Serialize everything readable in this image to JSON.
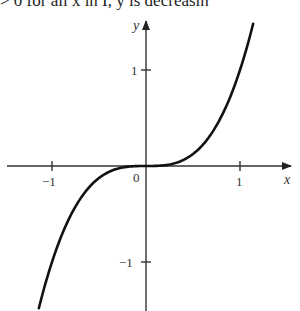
{
  "caption": {
    "text": "> 0 for all x in I, y is decreasin"
  },
  "chart_data": {
    "type": "line",
    "title": "",
    "function": "y = x^3",
    "xlabel": "x",
    "ylabel": "y",
    "xlim": [
      -1.45,
      1.55
    ],
    "ylim": [
      -1.5,
      1.5
    ],
    "grid": false,
    "legend": null,
    "x_ticks": [
      -1,
      1
    ],
    "x_tick_labels": [
      "-1",
      "1"
    ],
    "y_ticks": [
      1,
      -1
    ],
    "y_tick_labels": [
      "1",
      "-1"
    ],
    "origin_label": "0",
    "series": [
      {
        "name": "y = x^3",
        "x": [
          -1.14,
          -1.0,
          -0.8,
          -0.6,
          -0.4,
          -0.2,
          0.0,
          0.2,
          0.4,
          0.6,
          0.8,
          1.0,
          1.14
        ],
        "y": [
          -1.48,
          -1.0,
          -0.512,
          -0.216,
          -0.064,
          -0.008,
          0.0,
          0.008,
          0.064,
          0.216,
          0.512,
          1.0,
          1.48
        ]
      }
    ]
  },
  "labels": {
    "x_axis": "x",
    "y_axis": "y",
    "origin": "0",
    "x_neg1": "−1",
    "x_pos1": "1",
    "y_pos1": "1",
    "y_neg1": "−1"
  }
}
